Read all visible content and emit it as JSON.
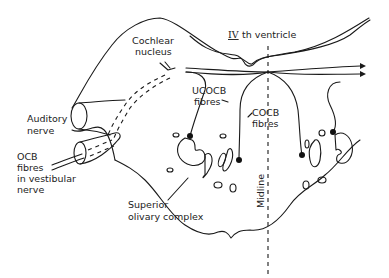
{
  "diagram": {
    "labels": {
      "ventricle_roman": "IV",
      "ventricle_text": "th ventricle",
      "cochlear_nucleus_1": "Cochlear",
      "cochlear_nucleus_2": "nucleus",
      "auditory_nerve_1": "Auditory",
      "auditory_nerve_2": "nerve",
      "ocb_1": "OCB",
      "ocb_2": "fibres",
      "ocb_3": "in  vestibular",
      "ocb_4": "nerve",
      "ucocb_1": "UCOCB",
      "ucocb_2": "fibres",
      "cocb_1": "COCB",
      "cocb_2": "fibres",
      "soc_1": "Superior",
      "soc_2": "olivary  complex",
      "midline": "Midline"
    },
    "colors": {
      "line": "#1a1a1a",
      "background": "#ffffff"
    }
  }
}
